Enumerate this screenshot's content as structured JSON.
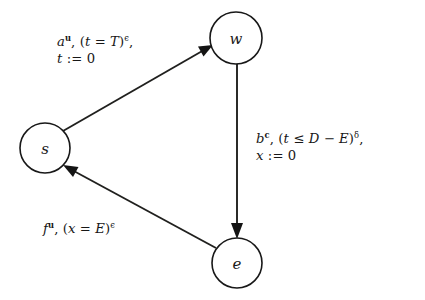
{
  "diagram": {
    "type": "directed-graph",
    "background_color": "#ffffff",
    "stroke_color": "#181818",
    "nodes": [
      {
        "id": "s",
        "label": "s",
        "cx": 45,
        "cy": 148,
        "r": 25
      },
      {
        "id": "w",
        "label": "w",
        "cx": 236,
        "cy": 38,
        "r": 26
      },
      {
        "id": "e",
        "label": "e",
        "cx": 237,
        "cy": 263,
        "r": 25
      }
    ],
    "edges": [
      {
        "id": "s-to-w",
        "from": "s",
        "to": "w",
        "label_lines": [
          {
            "parts": [
              {
                "text": "a",
                "style": "italic"
              },
              {
                "text": "u",
                "style": "sup-bold"
              },
              {
                "text": ", (",
                "style": "roman"
              },
              {
                "text": "t",
                "style": "italic"
              },
              {
                "text": " = ",
                "style": "roman"
              },
              {
                "text": "T",
                "style": "italic"
              },
              {
                "text": ")",
                "style": "roman"
              },
              {
                "text": "ϵ",
                "style": "sup"
              },
              {
                "text": ",",
                "style": "roman"
              }
            ]
          },
          {
            "parts": [
              {
                "text": "t",
                "style": "italic"
              },
              {
                "text": " := 0",
                "style": "roman"
              }
            ]
          }
        ],
        "label_plain": "a^u, (t = T)^ϵ, t := 0",
        "label_x": 57,
        "label_y": 33
      },
      {
        "id": "w-to-e",
        "from": "w",
        "to": "e",
        "label_lines": [
          {
            "parts": [
              {
                "text": "b",
                "style": "italic"
              },
              {
                "text": "c",
                "style": "sup-bold"
              },
              {
                "text": ", (",
                "style": "roman"
              },
              {
                "text": "t",
                "style": "italic"
              },
              {
                "text": " ≤ ",
                "style": "roman"
              },
              {
                "text": "D",
                "style": "italic"
              },
              {
                "text": " − ",
                "style": "roman"
              },
              {
                "text": "E",
                "style": "italic"
              },
              {
                "text": ")",
                "style": "roman"
              },
              {
                "text": "δ",
                "style": "sup"
              },
              {
                "text": ",",
                "style": "roman"
              }
            ]
          },
          {
            "parts": [
              {
                "text": "x",
                "style": "italic"
              },
              {
                "text": " := 0",
                "style": "roman"
              }
            ]
          }
        ],
        "label_plain": "b^c, (t ≤ D − E)^δ, x := 0",
        "label_x": 256,
        "label_y": 130
      },
      {
        "id": "e-to-s",
        "from": "e",
        "to": "s",
        "label_lines": [
          {
            "parts": [
              {
                "text": "f",
                "style": "italic"
              },
              {
                "text": "u",
                "style": "sup-bold"
              },
              {
                "text": ", (",
                "style": "roman"
              },
              {
                "text": "x",
                "style": "italic"
              },
              {
                "text": " = ",
                "style": "roman"
              },
              {
                "text": "E",
                "style": "italic"
              },
              {
                "text": ")",
                "style": "roman"
              },
              {
                "text": "ϵ",
                "style": "sup"
              }
            ]
          }
        ],
        "label_plain": "f^u, (x = E)^ϵ",
        "label_x": 43,
        "label_y": 220
      }
    ]
  }
}
